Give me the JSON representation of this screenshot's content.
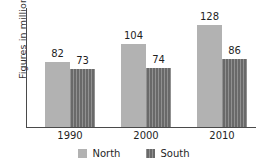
{
  "chart_data": {
    "type": "bar",
    "title": "",
    "xlabel": "",
    "ylabel": "Figures in millions",
    "categories": [
      "1990",
      "2000",
      "2010"
    ],
    "series": [
      {
        "name": "North",
        "values": [
          82,
          104,
          128
        ],
        "color": "#b2b2b2"
      },
      {
        "name": "South",
        "values": [
          73,
          74,
          86
        ],
        "color": "#757575"
      }
    ],
    "ylim": [
      0,
      150
    ],
    "grid": false,
    "legend_position": "bottom",
    "value_labels": [
      [
        "82",
        "73"
      ],
      [
        "104",
        "74"
      ],
      [
        "128",
        "86"
      ]
    ],
    "axis_color": "#4a4a4a",
    "background": "#ffffff"
  },
  "legend": {
    "items": [
      {
        "label": "North"
      },
      {
        "label": "South"
      }
    ]
  }
}
